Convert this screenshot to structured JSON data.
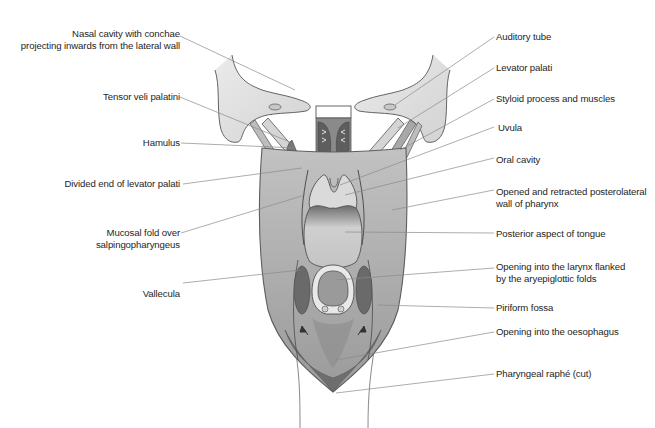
{
  "figure": {
    "type": "anatomical-diagram",
    "colors": {
      "background": "#ffffff",
      "pharynx_wall": "#b9b9b9",
      "pharynx_wall_edge": "#6a6a6a",
      "bone": "#dcdcdc",
      "muscle_dark": "#7a7a7a",
      "cavity_light": "#cfcfcf",
      "leader_line": "#8a8a8a",
      "text": "#1e1e1e"
    }
  },
  "labels_left": [
    {
      "id": "nasal-cavity",
      "lines": [
        "Nasal cavity with conchae",
        "projecting inwards from the lateral wall"
      ]
    },
    {
      "id": "tensor-veli-palatini",
      "lines": [
        "Tensor veli palatini"
      ]
    },
    {
      "id": "hamulus",
      "lines": [
        "Hamulus"
      ]
    },
    {
      "id": "divided-end-levator-palati",
      "lines": [
        "Divided end of levator palati"
      ]
    },
    {
      "id": "mucosal-fold",
      "lines": [
        "Mucosal fold over",
        "salpingopharyngeus"
      ]
    },
    {
      "id": "vallecula",
      "lines": [
        "Vallecula"
      ]
    }
  ],
  "labels_right": [
    {
      "id": "auditory-tube",
      "lines": [
        "Auditory tube"
      ]
    },
    {
      "id": "levator-palati",
      "lines": [
        "Levator palati"
      ]
    },
    {
      "id": "styloid-process",
      "lines": [
        "Styloid process and muscles"
      ]
    },
    {
      "id": "uvula",
      "lines": [
        "Uvula"
      ]
    },
    {
      "id": "oral-cavity",
      "lines": [
        "Oral cavity"
      ]
    },
    {
      "id": "posterolateral-wall",
      "lines": [
        "Opened and retracted posterolateral",
        "wall of pharynx"
      ]
    },
    {
      "id": "posterior-tongue",
      "lines": [
        "Posterior aspect of tongue"
      ]
    },
    {
      "id": "larynx-opening",
      "lines": [
        "Opening into the larynx flanked",
        "by the aryepiglottic folds"
      ]
    },
    {
      "id": "piriform-fossa",
      "lines": [
        "Piriform fossa"
      ]
    },
    {
      "id": "oesophagus-opening",
      "lines": [
        "Opening into the oesophagus"
      ]
    },
    {
      "id": "pharyngeal-raphe",
      "lines": [
        "Pharyngeal raphé (cut)"
      ]
    }
  ]
}
